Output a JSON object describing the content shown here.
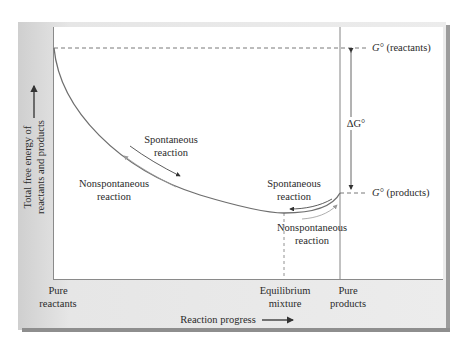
{
  "diagram": {
    "y_axis": {
      "label_line1": "Total free energy of",
      "label_line2": "reactants and products",
      "arrow": "up-arrow"
    },
    "x_axis": {
      "label": "Reaction progress",
      "arrow": "right-arrow",
      "left_end_line1": "Pure",
      "left_end_line2": "reactants",
      "equilibrium_line1": "Equilibrium",
      "equilibrium_line2": "mixture",
      "right_end_line1": "Pure",
      "right_end_line2": "products"
    },
    "levels": {
      "reactants_symbol": "G°",
      "reactants_text": " (reactants)",
      "products_symbol": "G°",
      "products_text": " (products)",
      "delta_label": "ΔG°"
    },
    "annotations": {
      "left_spontaneous_line1": "Spontaneous",
      "left_spontaneous_line2": "reaction",
      "left_nonspontaneous_line1": "Nonspontaneous",
      "left_nonspontaneous_line2": "reaction",
      "right_spontaneous_line1": "Spontaneous",
      "right_spontaneous_line2": "reaction",
      "right_nonspontaneous_line1": "Nonspontaneous",
      "right_nonspontaneous_line2": "reaction"
    },
    "colors": {
      "curve": "#6e6e6e",
      "panel": "#e8e8e8",
      "shadow": "#8e8e8e",
      "text": "#2a2a2a"
    }
  }
}
